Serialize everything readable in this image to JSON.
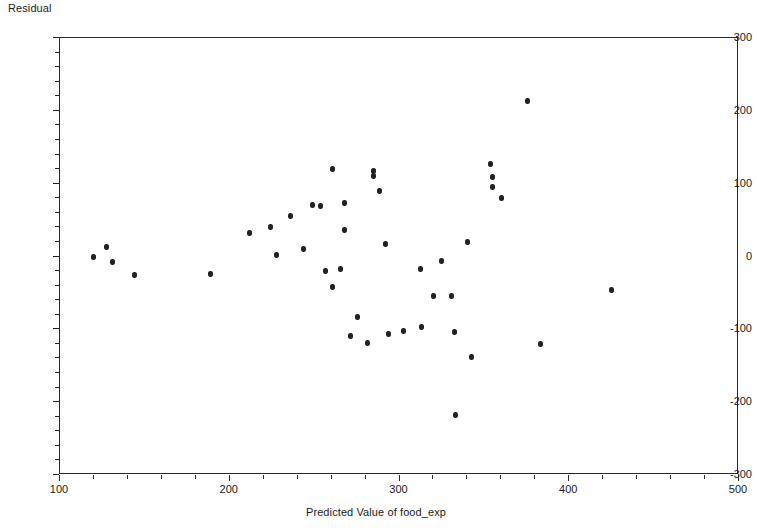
{
  "chart_data": {
    "type": "scatter",
    "title": "",
    "xlabel": "Predicted Value of food_exp",
    "ylabel": "Residual",
    "xlim": [
      100,
      500
    ],
    "ylim": [
      -300,
      300
    ],
    "x_major_ticks": [
      100,
      200,
      300,
      400,
      500
    ],
    "y_major_ticks": [
      300,
      200,
      100,
      0,
      -100,
      -200,
      -300
    ],
    "x_tick_labels": [
      "100",
      "200",
      "300",
      "400",
      "500"
    ],
    "y_tick_labels": [
      "300",
      "200",
      "100",
      "0",
      "-100",
      "-200",
      "-300"
    ],
    "x_minor_step": 20,
    "y_minor_step": 20,
    "grid": false,
    "legend": null,
    "marker": {
      "shape": "circle",
      "color": "#222222",
      "size": 5
    },
    "points": [
      {
        "x": 120.6,
        "y": -2
      },
      {
        "x": 127.7,
        "y": 12
      },
      {
        "x": 131.8,
        "y": -9
      },
      {
        "x": 144.2,
        "y": -27
      },
      {
        "x": 189.0,
        "y": -26
      },
      {
        "x": 212.1,
        "y": 31
      },
      {
        "x": 224.5,
        "y": 39
      },
      {
        "x": 228.1,
        "y": 1
      },
      {
        "x": 236.3,
        "y": 54
      },
      {
        "x": 244.0,
        "y": 9
      },
      {
        "x": 249.3,
        "y": 69
      },
      {
        "x": 254.0,
        "y": 68
      },
      {
        "x": 261.1,
        "y": 119
      },
      {
        "x": 257.0,
        "y": -21
      },
      {
        "x": 261.1,
        "y": -43
      },
      {
        "x": 265.8,
        "y": -18
      },
      {
        "x": 268.2,
        "y": 72
      },
      {
        "x": 268.2,
        "y": 35
      },
      {
        "x": 271.8,
        "y": -111
      },
      {
        "x": 276.0,
        "y": -84
      },
      {
        "x": 285.4,
        "y": 116
      },
      {
        "x": 285.4,
        "y": 109
      },
      {
        "x": 281.9,
        "y": -120
      },
      {
        "x": 288.9,
        "y": 88
      },
      {
        "x": 292.4,
        "y": 16
      },
      {
        "x": 294.2,
        "y": -108
      },
      {
        "x": 303.1,
        "y": -104
      },
      {
        "x": 313.1,
        "y": -19
      },
      {
        "x": 313.7,
        "y": -98
      },
      {
        "x": 320.8,
        "y": -56
      },
      {
        "x": 325.5,
        "y": -7
      },
      {
        "x": 331.4,
        "y": -56
      },
      {
        "x": 333.1,
        "y": -105
      },
      {
        "x": 333.8,
        "y": -219
      },
      {
        "x": 340.9,
        "y": 19
      },
      {
        "x": 343.2,
        "y": -139
      },
      {
        "x": 354.4,
        "y": 125
      },
      {
        "x": 355.6,
        "y": 108
      },
      {
        "x": 355.6,
        "y": 94
      },
      {
        "x": 360.9,
        "y": 79
      },
      {
        "x": 375.7,
        "y": 212
      },
      {
        "x": 383.4,
        "y": -121
      },
      {
        "x": 425.2,
        "y": -47
      }
    ]
  }
}
